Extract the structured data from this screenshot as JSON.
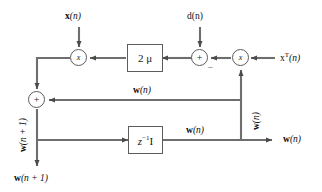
{
  "diagram": {
    "stroke_color": "#6e6e6e",
    "text_color": "#0d0d0d",
    "background": "#ffffff"
  },
  "nodes": {
    "left_multiplier": {
      "symbol": "x",
      "kind": "multiplier"
    },
    "right_multiplier": {
      "symbol": "x",
      "kind": "multiplier"
    },
    "error_sum": {
      "symbol": "+",
      "kind": "summing-junction"
    },
    "weight_adder": {
      "symbol": "+",
      "kind": "summing-junction"
    },
    "gain_block": {
      "label": "2 μ",
      "kind": "gain"
    },
    "delay_block": {
      "label_base": "z",
      "label_exp": "−1",
      "label_matrix": "I",
      "kind": "unit-delay"
    }
  },
  "signs": {
    "error_sum_negative": "–"
  },
  "labels": {
    "input_x": {
      "base": "x",
      "arg": "(n)"
    },
    "input_d": {
      "base": "d",
      "arg": "(n)"
    },
    "input_xT": {
      "base": "x",
      "sup": "T",
      "arg": "(n)"
    },
    "w_middle": {
      "base": "w",
      "arg": "(n)"
    },
    "w_bottom": {
      "base": "w",
      "arg": "(n)"
    },
    "w_output_right": {
      "base": "w",
      "arg": "(n)"
    },
    "w_vertical_right": {
      "base": "w",
      "arg": "(n)"
    },
    "w_next_vertical": {
      "base": "w",
      "arg": "(n + 1)"
    },
    "w_next_output": {
      "base": "w",
      "arg": "(n + 1)"
    }
  }
}
